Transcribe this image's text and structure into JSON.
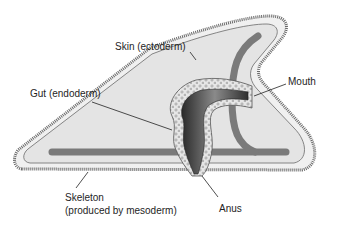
{
  "diagram": {
    "labels": {
      "skin": "Skin (ectoderm)",
      "gut": "Gut (endoderm)",
      "mouth": "Mouth",
      "anus": "Anus",
      "skeleton_line1": "Skeleton",
      "skeleton_line2": "(produced by mesoderm)"
    },
    "colors": {
      "body_fill": "#ececec",
      "inner_fill": "#e2e2e2",
      "outline": "#555555",
      "skeleton": "#7a7a7a",
      "gut_dark": "#3a3a3a",
      "gut_layer": "#dcdcdc",
      "leader": "#222222"
    }
  }
}
